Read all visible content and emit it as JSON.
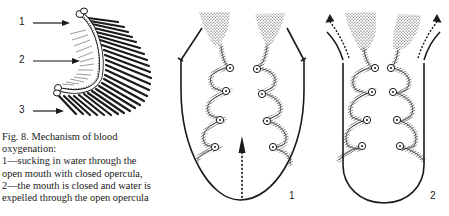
{
  "figure": {
    "labels": {
      "arch_1": "1",
      "arch_2": "2",
      "arch_3": "3",
      "diagram_1": "1",
      "diagram_2": "2"
    },
    "caption": {
      "line1": "Fig. 8. Mechanism of blood",
      "line2": "oxygenation:",
      "line3": "1—sucking in water through the",
      "line4": "open mouth with closed opercula,",
      "line5": "2—the mouth is closed and water is",
      "line6": "expelled through the open opercula"
    },
    "colors": {
      "ink": "#1a1a1a",
      "background": "#ffffff"
    }
  }
}
